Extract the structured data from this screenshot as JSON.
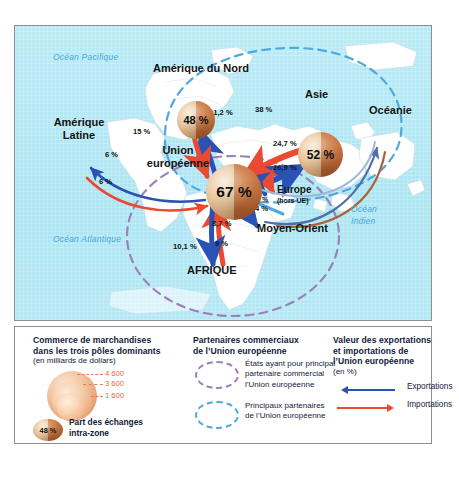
{
  "map": {
    "oceans": [
      {
        "name": "ocean-pacifique",
        "label": "Océan Pacifique"
      },
      {
        "name": "ocean-atlantique",
        "label": "Océan Atlantique"
      },
      {
        "name": "ocean-indien-l1",
        "label": "Océan"
      },
      {
        "name": "ocean-indien-l2",
        "label": "Indien"
      }
    ],
    "regions": [
      {
        "name": "amerique-du-nord",
        "label": "Amérique du Nord"
      },
      {
        "name": "amerique-latine-l1",
        "label": "Amérique"
      },
      {
        "name": "amerique-latine-l2",
        "label": "Latine"
      },
      {
        "name": "union-europeenne-l1",
        "label": "Union"
      },
      {
        "name": "union-europeenne-l2",
        "label": "européenne"
      },
      {
        "name": "asie",
        "label": "Asie"
      },
      {
        "name": "oceanie",
        "label": "Océanie"
      },
      {
        "name": "europe-hors-ue-l1",
        "label": "Europe"
      },
      {
        "name": "europe-hors-ue-l2",
        "label": "(hors UE)"
      },
      {
        "name": "moyen-orient",
        "label": "Moyen-Orient"
      },
      {
        "name": "afrique",
        "label": "AFRIQUE"
      }
    ],
    "spheres": [
      {
        "name": "sphere-amerique-du-nord",
        "region": "Amérique du Nord",
        "value": "48 %"
      },
      {
        "name": "sphere-asie",
        "region": "Asie",
        "value": "52 %"
      },
      {
        "name": "sphere-union-europeenne",
        "region": "Union européenne",
        "value": "67 %"
      }
    ],
    "flows": [
      {
        "name": "flow-ue-to-na-exports",
        "value": "21,2 %",
        "direction": "exportations"
      },
      {
        "name": "flow-na-to-ue-imports",
        "value": "15 %",
        "direction": "importations"
      },
      {
        "name": "flow-asie-to-ue-imports",
        "value": "38 %",
        "direction": "importations"
      },
      {
        "name": "flow-ue-to-asie-exports",
        "value": "24,7 %",
        "direction": "exportations"
      },
      {
        "name": "flow-ue-to-europe-exports",
        "value": "26,9 %",
        "direction": "exportations"
      },
      {
        "name": "flow-europe-to-ue-imports",
        "value": "27 %",
        "direction": "importations"
      },
      {
        "name": "flow-moyen-orient-imports",
        "value": "4 %",
        "direction": "importations"
      },
      {
        "name": "flow-ue-to-moyen-orient-exports",
        "value": "8,7 %",
        "direction": "exportations"
      },
      {
        "name": "flow-afrique-imports",
        "value": "10,1 %",
        "direction": "importations"
      },
      {
        "name": "flow-ue-to-afrique-exports",
        "value": "9 %",
        "direction": "exportations"
      },
      {
        "name": "flow-ue-to-amerique-latine-exports",
        "value": "6 %",
        "direction": "exportations"
      },
      {
        "name": "flow-amerique-latine-to-ue-imports",
        "value": "6 %",
        "direction": "importations"
      }
    ]
  },
  "legend": {
    "col1": {
      "title_l1": "Commerce de marchandises",
      "title_l2": "dans les trois pôles dominants",
      "subtitle": "(en milliards de dollars)",
      "bubbles": [
        {
          "name": "bubble-4600",
          "value": "4 600"
        },
        {
          "name": "bubble-3600",
          "value": "3 600"
        },
        {
          "name": "bubble-1600",
          "value": "1 600"
        }
      ],
      "intra": {
        "value": "48 %",
        "label_l1": "Part des échanges",
        "label_l2": "intra-zone"
      }
    },
    "col2": {
      "title_l1": "Partenaires commerciaux",
      "title_l2": "de l’Union européenne",
      "items": [
        {
          "name": "key-etats-partenaire-principal",
          "shape": "dashed-ellipse-violet",
          "color": "#9b82b8",
          "text_l1": "États ayant pour principal",
          "text_l2": "partenaire commercial",
          "text_l3": "l’Union européenne"
        },
        {
          "name": "key-principaux-partenaires",
          "shape": "dashed-ellipse-blue",
          "color": "#4fa9de",
          "text_l1": "Principaux partenaires",
          "text_l2": "de l’Union européenne",
          "text_l3": ""
        }
      ]
    },
    "col3": {
      "title_l1": "Valeur des exportations",
      "title_l2": "et importations de",
      "title_l3": "l’Union européenne",
      "subtitle": "(en %)",
      "items": [
        {
          "name": "key-exportations",
          "label": "Exportations",
          "color": "#2a52b5"
        },
        {
          "name": "key-importations",
          "label": "Importations",
          "color": "#ea4a32"
        }
      ]
    }
  },
  "colors": {
    "ocean_fill": "#b7e9f4",
    "land_fill": "#ffffff",
    "export_blue": "#2a52b5",
    "import_red": "#ea4a32",
    "partner_violet": "#9b82b8",
    "partner_blue": "#4fa9de",
    "label_dark": "#13213a"
  }
}
